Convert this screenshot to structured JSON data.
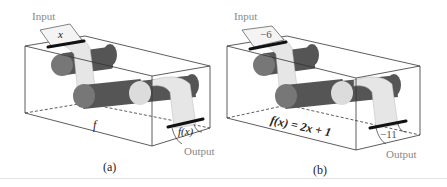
{
  "figure": {
    "panels": [
      {
        "id": "a",
        "input_label": "Input",
        "output_label": "Output",
        "input_value": "x",
        "output_value": "f(x)",
        "machine_label": "f",
        "caption": "(a)"
      },
      {
        "id": "b",
        "input_label": "Input",
        "output_label": "Output",
        "input_value": "−6",
        "output_value": "−11",
        "machine_label": "f(x) = 2x + 1",
        "caption": "(b)"
      }
    ],
    "colors": {
      "roller_dark": "#555555",
      "roller_mid": "#777777",
      "roller_light": "#dcdcdc",
      "paper": "#e6e6e6",
      "box_line": "#333333",
      "label_gray": "#8a8a8a"
    }
  }
}
